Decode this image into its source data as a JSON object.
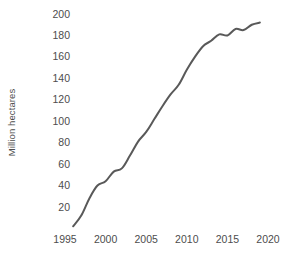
{
  "chart_data": {
    "type": "line",
    "title": "",
    "subtitle": "",
    "xlabel": "",
    "ylabel": "Million hectares",
    "xlim": [
      1995,
      2020
    ],
    "ylim": [
      0,
      200
    ],
    "grid": false,
    "legend": null,
    "legend_position": "none",
    "line_color": "#595959",
    "line_width_px": 2,
    "x_ticks": [
      1995,
      2000,
      2005,
      2010,
      2015,
      2020
    ],
    "x_tick_labels": [
      "1995",
      "2000",
      "2005",
      "2010",
      "2015",
      "2020"
    ],
    "y_ticks": [
      20,
      40,
      60,
      80,
      100,
      120,
      140,
      160,
      180,
      200
    ],
    "y_tick_labels": [
      "20",
      "40",
      "60",
      "80",
      "100",
      "120",
      "140",
      "160",
      "180",
      "200"
    ],
    "series": [
      {
        "name": "Million hectares",
        "x": [
          1996,
          1997,
          1998,
          1999,
          2000,
          2001,
          2002,
          2003,
          2004,
          2005,
          2006,
          2007,
          2008,
          2009,
          2010,
          2011,
          2012,
          2013,
          2014,
          2015,
          2016,
          2017,
          2018,
          2019
        ],
        "values": [
          2,
          12,
          28,
          40,
          44,
          53,
          56,
          68,
          81,
          90,
          102,
          114,
          125,
          134,
          148,
          160,
          170,
          175,
          181,
          180,
          186,
          185,
          190,
          192
        ]
      }
    ]
  },
  "axes": {
    "y_title": "Million hectares",
    "y_tick_labels": [
      "200",
      "180",
      "160",
      "140",
      "120",
      "100",
      "80",
      "60",
      "40",
      "20"
    ],
    "x_tick_labels": [
      "1995",
      "2000",
      "2005",
      "2010",
      "2015",
      "2020"
    ]
  }
}
